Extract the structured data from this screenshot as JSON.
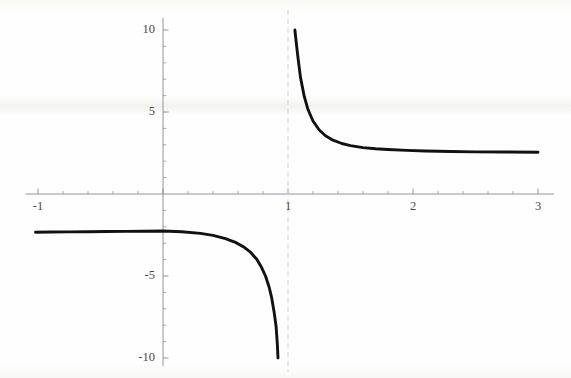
{
  "figure": {
    "title": "",
    "background_color": "#fefefe",
    "width": 571,
    "height": 378
  },
  "axes": {
    "axis_color": "#8a8a8a",
    "curve_color": "#111111",
    "asymptote_color": "#cfd6d0",
    "tick_label_color": "#4a4a4a",
    "origin_px": {
      "x": 163,
      "y": 194
    },
    "px_per_unit": {
      "x": 125,
      "y": 16.4
    },
    "x_labels": [
      {
        "text": "-1",
        "value": -1
      },
      {
        "text": "1",
        "value": 1
      },
      {
        "text": "2",
        "value": 2
      },
      {
        "text": "3",
        "value": 3
      }
    ],
    "y_labels": [
      {
        "text": "10",
        "value": 10
      },
      {
        "text": "5",
        "value": 5
      },
      {
        "text": "-5",
        "value": -5
      },
      {
        "text": "-10",
        "value": -10
      }
    ]
  },
  "chart_data": {
    "type": "line",
    "title": "",
    "xlabel": "",
    "ylabel": "",
    "xlim": [
      -1.02,
      3.0
    ],
    "ylim": [
      -10.0,
      10.0
    ],
    "grid": false,
    "legend": null,
    "xticks": [
      -1,
      1,
      2,
      3
    ],
    "xtick_labels": [
      "-1",
      "1",
      "2",
      "3"
    ],
    "yticks": [
      -10,
      -5,
      5,
      10
    ],
    "ytick_labels": [
      "-10",
      "-5",
      "5",
      "10"
    ],
    "x_minor_tick_step": 0.2,
    "y_minor_tick_step": 1,
    "vertical_asymptote": {
      "x": 1,
      "style": "dashed",
      "color": "#cfd6d0"
    },
    "horizontal_asymptote": {
      "y": 2.55
    },
    "annotations": [],
    "series": [
      {
        "name": "left-branch",
        "comment": "branch for x < 1, plateaus near y = -2.3 then dives to -10 near x = 1",
        "x": [
          -1.02,
          -0.9,
          -0.75,
          -0.6,
          -0.45,
          -0.3,
          -0.15,
          0.0,
          0.15,
          0.3,
          0.4,
          0.5,
          0.58,
          0.65,
          0.7,
          0.75,
          0.79,
          0.82,
          0.85,
          0.87,
          0.89,
          0.905,
          0.915,
          0.92
        ],
        "y": [
          -2.33,
          -2.32,
          -2.31,
          -2.3,
          -2.29,
          -2.28,
          -2.27,
          -2.26,
          -2.3,
          -2.4,
          -2.52,
          -2.72,
          -2.95,
          -3.25,
          -3.55,
          -3.98,
          -4.5,
          -5.0,
          -5.7,
          -6.35,
          -7.25,
          -8.1,
          -9.2,
          -10.0
        ]
      },
      {
        "name": "right-branch",
        "comment": "branch for x > 1, falls from y = 10 and flattens toward y = 2.55",
        "x": [
          1.055,
          1.065,
          1.08,
          1.1,
          1.13,
          1.16,
          1.2,
          1.25,
          1.3,
          1.36,
          1.43,
          1.5,
          1.6,
          1.7,
          1.8,
          1.95,
          2.1,
          2.3,
          2.5,
          2.75,
          3.0
        ],
        "y": [
          10.0,
          9.3,
          8.3,
          7.1,
          5.95,
          5.15,
          4.45,
          3.9,
          3.55,
          3.28,
          3.08,
          2.95,
          2.83,
          2.76,
          2.71,
          2.66,
          2.62,
          2.59,
          2.57,
          2.56,
          2.55
        ]
      }
    ]
  }
}
